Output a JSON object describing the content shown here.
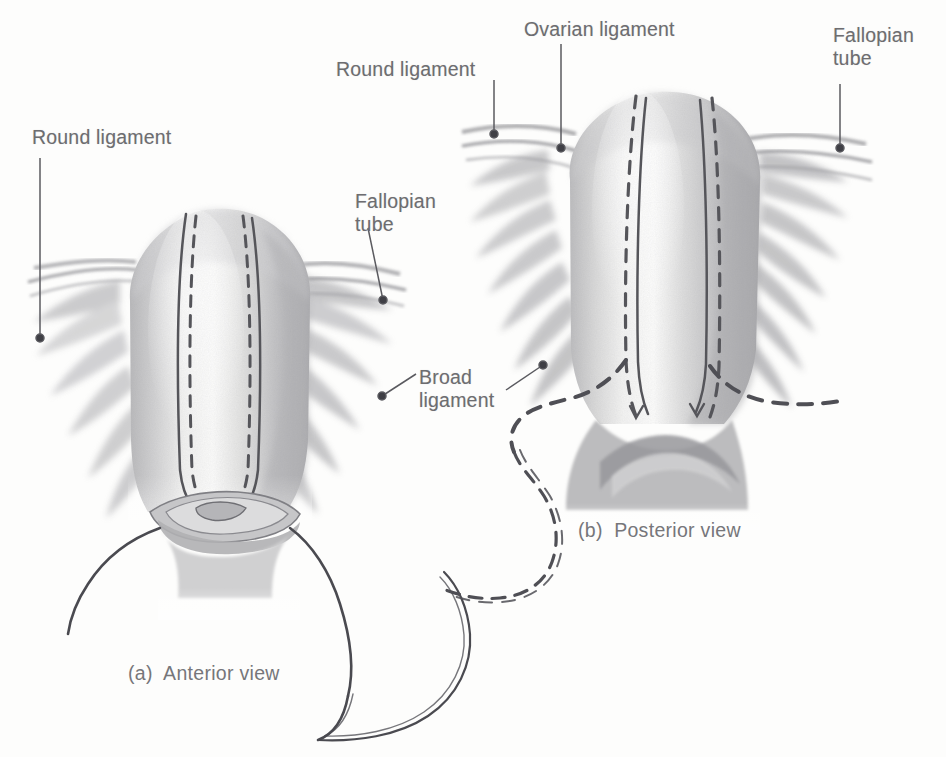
{
  "figure": {
    "medium": "grayscale pencil anatomical illustration",
    "background_color": "#fdfdfc",
    "label_color": "#6d6d70",
    "line_color": "#55555a",
    "ink_color": "#4a4a50"
  },
  "labels": [
    {
      "id": "round-ligament-left",
      "text": "Round ligament",
      "x": 32,
      "y": 126,
      "align": "left"
    },
    {
      "id": "fallopian-tube-left",
      "text": "Fallopian\ntube",
      "x": 355,
      "y": 190,
      "align": "left"
    },
    {
      "id": "broad-ligament",
      "text": "Broad\nligament",
      "x": 419,
      "y": 366,
      "align": "left"
    },
    {
      "id": "round-ligament-right",
      "text": "Round ligament",
      "x": 336,
      "y": 58,
      "align": "left"
    },
    {
      "id": "ovarian-ligament",
      "text": "Ovarian ligament",
      "x": 524,
      "y": 18,
      "align": "left"
    },
    {
      "id": "fallopian-tube-right",
      "text": "Fallopian\ntube",
      "x": 833,
      "y": 24,
      "align": "left"
    }
  ],
  "captions": [
    {
      "id": "caption-a",
      "marker": "(a)",
      "text": "(a)  Anterior view",
      "x": 128,
      "y": 662
    },
    {
      "id": "caption-b",
      "marker": "(b)",
      "text": "(b)  Posterior view",
      "x": 578,
      "y": 519
    }
  ],
  "leaders": [
    {
      "id": "leader-round-ligament-left",
      "from": [
        40,
        158
      ],
      "to": [
        40,
        338
      ],
      "dot_at": "to"
    },
    {
      "id": "leader-fallopian-tube-left",
      "from": [
        368,
        228
      ],
      "to": [
        383,
        300
      ],
      "dot_at": "to"
    },
    {
      "id": "leader-broad-ligament-left",
      "from": [
        416,
        374
      ],
      "to": [
        382,
        396
      ],
      "dot_at": "to"
    },
    {
      "id": "leader-broad-ligament-right",
      "from": [
        506,
        390
      ],
      "to": [
        543,
        365
      ],
      "dot_at": "to"
    },
    {
      "id": "leader-round-ligament-right",
      "from": [
        494,
        80
      ],
      "to": [
        494,
        134
      ],
      "dot_at": "to"
    },
    {
      "id": "leader-ovarian-ligament",
      "from": [
        561,
        44
      ],
      "to": [
        561,
        148
      ],
      "dot_at": "to"
    },
    {
      "id": "leader-fallopian-tube-right",
      "from": [
        840,
        84
      ],
      "to": [
        840,
        148
      ],
      "dot_at": "to"
    }
  ],
  "figure_a": {
    "name": "anterior-view-uterus",
    "center_x": 210,
    "incision_lines": [
      {
        "id": "a-incision-solid-left",
        "style": "solid"
      },
      {
        "id": "a-incision-dashed-left",
        "style": "dashed"
      },
      {
        "id": "a-incision-solid-right",
        "style": "solid"
      },
      {
        "id": "a-incision-dashed-right",
        "style": "dashed"
      }
    ],
    "suture": {
      "id": "suture-thread-and-needle",
      "description": "curved needle with thread passing through cervix"
    }
  },
  "figure_b": {
    "name": "posterior-view-uterus",
    "center_x": 660,
    "incision_lines": [
      {
        "id": "b-incision-dashed-left",
        "style": "dashed"
      },
      {
        "id": "b-incision-solid-left",
        "style": "solid"
      },
      {
        "id": "b-incision-solid-right",
        "style": "solid"
      },
      {
        "id": "b-incision-dashed-right",
        "style": "dashed"
      }
    ],
    "dissection_outline": {
      "id": "b-dashed-dissection-curve",
      "style": "dashed"
    }
  }
}
